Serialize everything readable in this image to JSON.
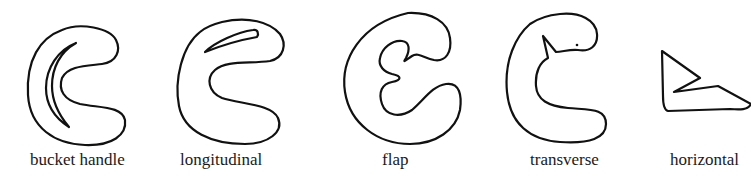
{
  "diagram": {
    "type": "meniscus-tear-types",
    "stroke_color": "#111111",
    "background": "#ffffff",
    "figures": [
      {
        "id": "bucket-handle",
        "label": "bucket handle"
      },
      {
        "id": "longitudinal",
        "label": "longitudinal"
      },
      {
        "id": "flap",
        "label": "flap"
      },
      {
        "id": "transverse",
        "label": "transverse"
      },
      {
        "id": "horizontal",
        "label": "horizontal"
      }
    ]
  }
}
